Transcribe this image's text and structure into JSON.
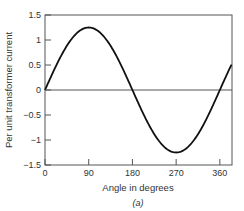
{
  "chart_data": {
    "type": "line",
    "title": "",
    "caption": "(a)",
    "xlabel": "Angle in degrees",
    "ylabel": "Per unit transformer current",
    "xlim": [
      0,
      385
    ],
    "ylim": [
      -1.5,
      1.5
    ],
    "xticks": [
      0,
      90,
      180,
      270,
      360
    ],
    "xtick_labels": [
      "0",
      "90",
      "180",
      "270",
      "360"
    ],
    "yticks": [
      1.5,
      1,
      0.5,
      0,
      -0.5,
      -1,
      -1.5
    ],
    "ytick_labels": [
      "1.5",
      "1",
      "0.5",
      "0",
      "−0.5",
      "−1",
      "−1.5"
    ],
    "grid": false,
    "zero_line": true,
    "series": [
      {
        "name": "Per unit transformer current",
        "function": "1.25*sin(angle)",
        "amplitude": 1.25,
        "x": [
          0,
          30,
          60,
          90,
          120,
          150,
          180,
          210,
          240,
          270,
          300,
          330,
          360,
          385
        ],
        "values": [
          0,
          0.63,
          1.08,
          1.25,
          1.08,
          0.63,
          0,
          -0.63,
          -1.08,
          -1.25,
          -1.08,
          -0.63,
          0,
          0.53
        ],
        "color": "#111111"
      }
    ]
  }
}
